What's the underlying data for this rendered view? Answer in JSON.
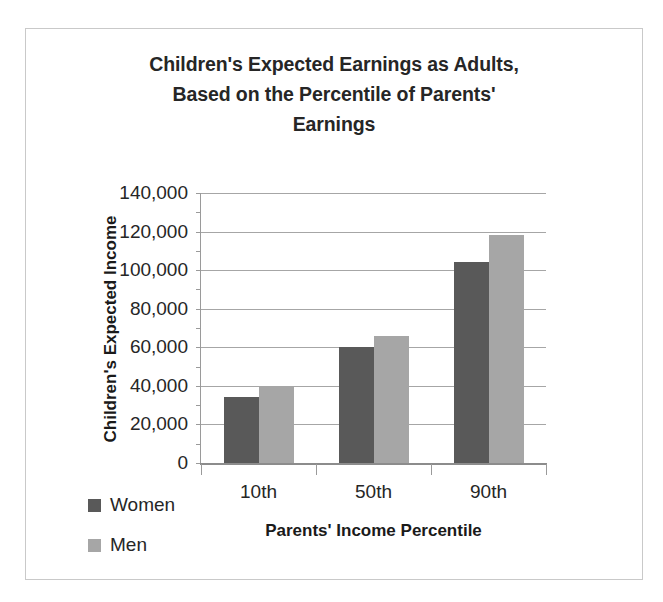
{
  "chart_data": {
    "type": "bar",
    "title": "Children's Expected Earnings as Adults, Based on the Percentile of Parents' Earnings",
    "title_lines": [
      "Children's Expected Earnings as Adults,",
      "Based on the Percentile of Parents'",
      "Earnings"
    ],
    "xlabel": "Parents' Income Percentile",
    "ylabel": "Children's Expected Income",
    "categories": [
      "10th",
      "50th",
      "90th"
    ],
    "series": [
      {
        "name": "Women",
        "color": "#595959",
        "values": [
          34000,
          60000,
          104000
        ]
      },
      {
        "name": "Men",
        "color": "#a6a6a6",
        "values": [
          40000,
          66000,
          118000
        ]
      }
    ],
    "ylim": [
      0,
      140000
    ],
    "ytick_values": [
      0,
      20000,
      40000,
      60000,
      80000,
      100000,
      120000,
      140000
    ],
    "ytick_labels": [
      "0",
      "20,000",
      "40,000",
      "60,000",
      "80,000",
      "100,000",
      "120,000",
      "140,000"
    ],
    "grid": true,
    "legend_position": "bottom-left",
    "legend_entries": [
      "Women",
      "Men"
    ]
  }
}
